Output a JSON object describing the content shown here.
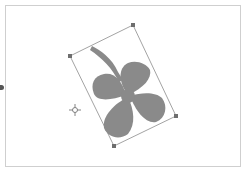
{
  "canvas": {
    "background": "#ffffff",
    "frame_color": "#cfcfcf"
  },
  "selection": {
    "object": "four-leaf-clover",
    "fill_color": "#8a8a8a",
    "bbox_color": "#8c8c8c",
    "handle_color": "#6e6e6e",
    "handles": [
      {
        "x": 70,
        "y": 56
      },
      {
        "x": 133,
        "y": 25
      },
      {
        "x": 176,
        "y": 116
      },
      {
        "x": 114,
        "y": 146
      }
    ]
  },
  "pivot": {
    "icon": "crosshair-icon",
    "x": 75,
    "y": 110
  },
  "edge_marker": {
    "icon": "dot-icon"
  }
}
